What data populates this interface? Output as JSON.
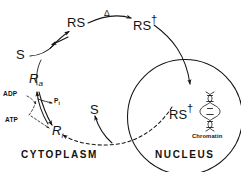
{
  "diagram": {
    "type": "biochemical-pathway",
    "background_color": "#ffffff",
    "stroke_color": "#141414",
    "compartments": [
      {
        "id": "cytoplasm",
        "label": "CYTOPLASM"
      },
      {
        "id": "nucleus",
        "label": "NUCLEUS"
      }
    ],
    "species": [
      {
        "id": "s-cyto",
        "label": "S",
        "note": "free steroid in cytoplasm"
      },
      {
        "id": "rs",
        "label": "RS",
        "note": "receptor-steroid complex"
      },
      {
        "id": "rs-prime-cyto",
        "label": "RS",
        "prime": "†",
        "note": "transformed receptor-steroid complex in cytoplasm"
      },
      {
        "id": "rs-prime-nuc",
        "label": "RS",
        "prime": "†",
        "note": "transformed complex bound in nucleus"
      },
      {
        "id": "r-active",
        "label": "R",
        "subscript": "a",
        "note": "active receptor"
      },
      {
        "id": "r-inactive",
        "label": "R",
        "subscript": "i",
        "note": "inactive receptor"
      },
      {
        "id": "s-return",
        "label": "S",
        "note": "steroid released back to cytoplasm"
      }
    ],
    "cofactors": [
      {
        "id": "adp",
        "label": "ADP"
      },
      {
        "id": "atp",
        "label": "ATP"
      },
      {
        "id": "pi",
        "label": "P",
        "subscript": "i"
      }
    ],
    "annotations": [
      {
        "id": "delta",
        "label": "Δ",
        "note": "temperature / activation step above arrow RS to RS-prime"
      },
      {
        "id": "chromatin",
        "label": "Chromatin",
        "note": "DNA double helix in nucleus"
      }
    ],
    "edges": [
      {
        "id": "s-to-rs",
        "from": "S",
        "to": "RS",
        "style": "solid",
        "arrows": "double"
      },
      {
        "id": "rs-to-rsprime",
        "from": "RS",
        "to": "RS†",
        "style": "solid",
        "arrows": "single",
        "label": "Δ"
      },
      {
        "id": "rsprime-to-nucleus",
        "from": "RS†",
        "to": "nucleus",
        "style": "solid",
        "arrows": "single"
      },
      {
        "id": "nucleus-to-ri",
        "from": "nucleus",
        "to": "R i",
        "style": "dashed",
        "arrows": "single"
      },
      {
        "id": "s-release",
        "from": "nucleus",
        "to": "S",
        "style": "solid",
        "arrows": "single"
      },
      {
        "id": "ri-to-ra",
        "from": "R i",
        "to": "R a",
        "style": "solid",
        "arrows": "single"
      },
      {
        "id": "ra-to-ri",
        "from": "R a",
        "to": "R i",
        "style": "solid",
        "arrows": "single"
      },
      {
        "id": "adp-in",
        "from": "ADP",
        "to": "R a",
        "style": "dashed",
        "arrows": "single"
      },
      {
        "id": "atp-in",
        "from": "ATP",
        "to": "R a",
        "style": "dashed",
        "arrows": "single"
      },
      {
        "id": "pi-out",
        "from": "R a",
        "to": "P i",
        "style": "solid",
        "arrows": "single"
      },
      {
        "id": "ra-to-rs",
        "from": "R a",
        "to": "S/RS junction",
        "style": "solid",
        "arrows": "none"
      }
    ]
  }
}
